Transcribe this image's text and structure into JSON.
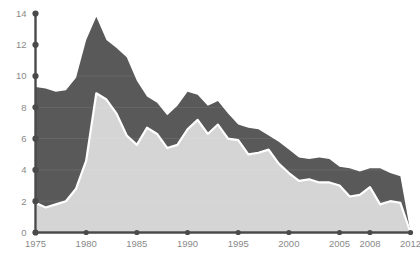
{
  "chart_data": {
    "type": "area",
    "stacked": true,
    "title": "",
    "subtitle": "",
    "xlabel": "",
    "ylabel": "",
    "xlim": [
      1975,
      2012
    ],
    "ylim": [
      0,
      14
    ],
    "grid": false,
    "legend_position": "none",
    "x": [
      1975,
      1976,
      1977,
      1978,
      1979,
      1980,
      1981,
      1982,
      1983,
      1984,
      1985,
      1986,
      1987,
      1988,
      1989,
      1990,
      1991,
      1992,
      1993,
      1994,
      1995,
      1996,
      1997,
      1998,
      1999,
      2000,
      2001,
      2002,
      2003,
      2004,
      2005,
      2006,
      2007,
      2008,
      2009,
      2010,
      2011,
      2012
    ],
    "xtick_labels": [
      "1975",
      "1980",
      "1985",
      "1990",
      "1995",
      "2000",
      "2005",
      "2008",
      "2012"
    ],
    "xtick_values": [
      1975,
      1980,
      1985,
      1990,
      1995,
      2000,
      2005,
      2008,
      2012
    ],
    "ytick_labels": [
      "0",
      "2",
      "4",
      "6",
      "8",
      "10",
      "12",
      "14"
    ],
    "ytick_values": [
      0,
      2,
      4,
      6,
      8,
      10,
      12,
      14
    ],
    "series": [
      {
        "name": "lower-series",
        "color": "#d5d5d5",
        "values": [
          1.9,
          1.6,
          1.8,
          2.0,
          2.8,
          4.6,
          8.9,
          8.5,
          7.6,
          6.2,
          5.6,
          6.7,
          6.3,
          5.4,
          5.6,
          6.6,
          7.2,
          6.3,
          6.9,
          6.0,
          5.9,
          5.0,
          5.1,
          5.3,
          4.4,
          3.8,
          3.3,
          3.4,
          3.2,
          3.2,
          3.0,
          2.3,
          2.4,
          2.9,
          1.8,
          2.0,
          1.9,
          0.0
        ]
      },
      {
        "name": "upper-series",
        "color": "#595959",
        "values": [
          7.4,
          7.6,
          7.2,
          7.1,
          7.1,
          7.7,
          4.9,
          3.8,
          4.2,
          5.0,
          4.1,
          2.0,
          2.0,
          2.1,
          2.5,
          2.4,
          1.6,
          1.8,
          1.5,
          1.6,
          1.0,
          1.7,
          1.5,
          0.9,
          1.4,
          1.5,
          1.5,
          1.3,
          1.6,
          1.5,
          1.2,
          1.8,
          1.5,
          1.2,
          2.3,
          1.8,
          1.7,
          0.0
        ]
      }
    ],
    "totals": [
      9.3,
      9.2,
      9.0,
      9.1,
      9.9,
      12.3,
      13.8,
      12.3,
      11.8,
      11.2,
      9.7,
      8.7,
      8.3,
      7.5,
      8.1,
      9.0,
      8.8,
      8.1,
      8.4,
      7.6,
      6.9,
      6.7,
      6.6,
      6.2,
      5.8,
      5.3,
      4.8,
      4.7,
      4.8,
      4.7,
      4.2,
      4.1,
      3.9,
      4.1,
      4.1,
      3.8,
      3.6,
      0.0
    ],
    "colors": {
      "upper": "#595959",
      "lower": "#d5d5d5",
      "separator": "#ffffff",
      "axis": "#4a4a4a",
      "tick_label": "#8a8a8a",
      "background": "#ffffff"
    }
  }
}
